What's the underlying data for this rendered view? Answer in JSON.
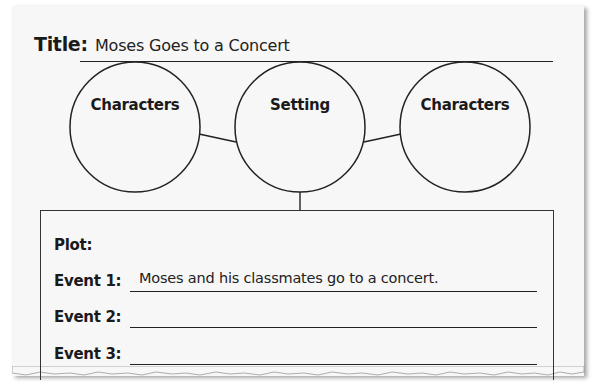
{
  "worksheet": {
    "title_label": "Title:",
    "title_value": "Moses Goes to a Concert",
    "circles": [
      {
        "label": "Characters"
      },
      {
        "label": "Setting"
      },
      {
        "label": "Characters"
      }
    ],
    "plot": {
      "label": "Plot:",
      "events": [
        {
          "label": "Event 1:",
          "value": "Moses and his classmates go to a concert."
        },
        {
          "label": "Event 2:",
          "value": ""
        },
        {
          "label": "Event 3:",
          "value": ""
        }
      ]
    }
  },
  "colors": {
    "paper": "#f7f7f7",
    "ink": "#1a1a1a"
  }
}
